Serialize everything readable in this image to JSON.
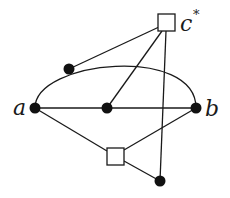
{
  "diagram": {
    "type": "graph",
    "labels": {
      "a": "a",
      "b": "b",
      "c": "c",
      "c_sup": "*"
    },
    "nodes": [
      {
        "id": "a",
        "shape": "dot",
        "x": 35,
        "y": 108,
        "label": "a"
      },
      {
        "id": "b",
        "shape": "dot",
        "x": 196,
        "y": 108,
        "label": "b"
      },
      {
        "id": "m",
        "shape": "dot",
        "x": 107,
        "y": 108
      },
      {
        "id": "t",
        "shape": "dot",
        "x": 69,
        "y": 69
      },
      {
        "id": "d",
        "shape": "dot",
        "x": 160,
        "y": 181
      },
      {
        "id": "c",
        "shape": "square",
        "x": 166,
        "y": 22,
        "label": "c*"
      },
      {
        "id": "s",
        "shape": "square",
        "x": 115,
        "y": 156
      }
    ],
    "edges": [
      {
        "from": "a",
        "to": "b",
        "kind": "straight"
      },
      {
        "from": "a",
        "to": "b",
        "kind": "arc",
        "via": "t"
      },
      {
        "from": "c",
        "to": "t"
      },
      {
        "from": "c",
        "to": "m"
      },
      {
        "from": "c",
        "to": "d"
      },
      {
        "from": "a",
        "to": "s"
      },
      {
        "from": "b",
        "to": "s"
      },
      {
        "from": "s",
        "to": "d"
      }
    ],
    "colors": {
      "stroke": "#1a1a1a",
      "dot": "#111111",
      "background": "#ffffff"
    }
  }
}
